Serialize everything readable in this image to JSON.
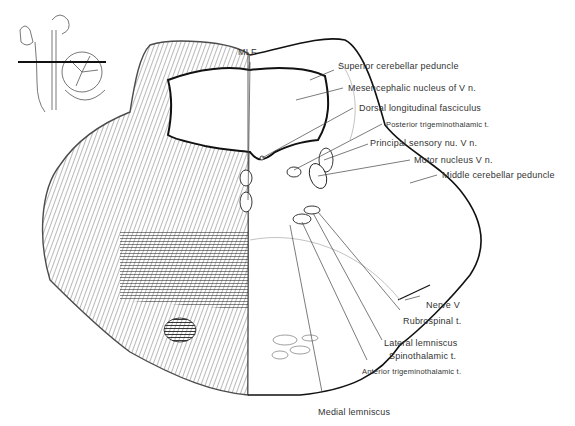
{
  "diagram": {
    "inset": {
      "name": "brainstem-sagittal-inset",
      "description": "Sagittal view of brainstem and cerebellum with horizontal section line"
    },
    "labels": {
      "mlf": "MLF",
      "superior_cerebellar_peduncle": "Superior cerebellar peduncle",
      "mesencephalic_nucleus": "Mesencephalic nucleus of V n.",
      "dorsal_longitudinal_fasciculus": "Dorsal longitudinal fasciculus",
      "posterior_trigeminothalamic": "Posterior trigeminothalamic t.",
      "principal_sensory": "Principal sensory nu. V n.",
      "motor_nucleus": "Motor nucleus V n.",
      "middle_cerebellar_peduncle": "Middle cerebellar peduncle",
      "nerve_v": "Nerve V",
      "rubrospinal": "Rubrospinal t.",
      "lateral_lemniscus": "Lateral lemniscus",
      "spinothalamic": "Spinothalamic t.",
      "anterior_trigeminothalamic": "Anterior trigeminothalamic t.",
      "medial_lemniscus": "Medial lemniscus"
    },
    "colors": {
      "ink": "#222222",
      "leader": "#444444",
      "background": "#ffffff"
    }
  }
}
